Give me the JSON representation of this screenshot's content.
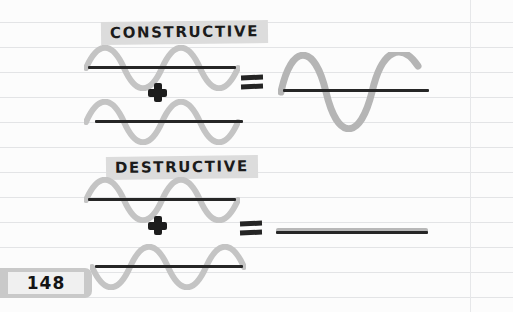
{
  "page": {
    "number": "148",
    "paper": {
      "background_color": "#fcfcfc",
      "rule_color": "#e3e4e6",
      "rule_positions": [
        22,
        47,
        72,
        97,
        122,
        147,
        172,
        197,
        222,
        247,
        272,
        297
      ],
      "margin_line_x": 470
    }
  },
  "sections": [
    {
      "id": "constructive",
      "heading": "CONSTRUCTIVE",
      "heading_highlight_color": "#dcdcdc",
      "operator_plus": "+",
      "operator_equals": "=",
      "input_wave_1": {
        "label": "wave-1",
        "amplitude": 17,
        "cycles": 2,
        "phase": "positive-first",
        "color": "#c4c4c4"
      },
      "input_wave_2": {
        "label": "wave-2",
        "amplitude": 17,
        "cycles": 2,
        "phase": "positive-first",
        "color": "#c4c4c4"
      },
      "result_wave": {
        "label": "constructive-result",
        "amplitude": 34,
        "cycles": 2,
        "phase": "positive-first",
        "color": "#b5b5b5"
      }
    },
    {
      "id": "destructive",
      "heading": "DESTRUCTIVE",
      "heading_highlight_color": "#dcdcdc",
      "operator_plus": "+",
      "operator_equals": "=",
      "input_wave_1": {
        "label": "wave-1",
        "amplitude": 17,
        "cycles": 2,
        "phase": "positive-first",
        "color": "#c4c4c4"
      },
      "input_wave_2": {
        "label": "wave-2",
        "amplitude": 17,
        "cycles": 2,
        "phase": "negative-first",
        "color": "#c4c4c4"
      },
      "result_wave": {
        "label": "destructive-result",
        "amplitude": 0,
        "cycles": 0,
        "phase": "flat",
        "color": "#b8b8b8"
      }
    }
  ],
  "colors": {
    "axis_line": "#262626",
    "wave_gray": "#c4c4c4",
    "result_gray": "#b5b5b5",
    "ink": "#1b1b1b",
    "tab_gray": "#c9c9c9"
  }
}
